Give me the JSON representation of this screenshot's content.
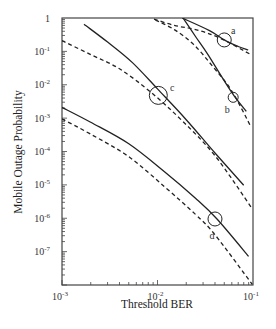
{
  "chart_data": {
    "type": "line",
    "title": "",
    "xlabel": "Threshold BER",
    "ylabel": "Mobile Outage Probability",
    "xscale": "log",
    "yscale": "log",
    "xlim": [
      0.001,
      0.1
    ],
    "ylim": [
      1e-08,
      1
    ],
    "grid": false,
    "legend": null,
    "x_ticks": [
      {
        "value": 0.001,
        "base": "10",
        "exp": "-3"
      },
      {
        "value": 0.01,
        "base": "10",
        "exp": "-2"
      },
      {
        "value": 0.1,
        "base": "10",
        "exp": "-1"
      }
    ],
    "y_ticks": [
      {
        "value": 1,
        "base": "1",
        "exp": ""
      },
      {
        "value": 0.1,
        "base": "10",
        "exp": "-1"
      },
      {
        "value": 0.01,
        "base": "10",
        "exp": "-2"
      },
      {
        "value": 0.001,
        "base": "10",
        "exp": "-3"
      },
      {
        "value": 0.0001,
        "base": "10",
        "exp": "-4"
      },
      {
        "value": 1e-05,
        "base": "10",
        "exp": "-5"
      },
      {
        "value": 1e-06,
        "base": "10",
        "exp": "-6"
      },
      {
        "value": 1e-07,
        "base": "10",
        "exp": "-7"
      }
    ],
    "series": [
      {
        "name": "a-solid",
        "style": "solid",
        "x": [
          0.0181,
          0.035,
          0.05,
          0.07,
          0.089
        ],
        "y": [
          1.0,
          0.42,
          0.22,
          0.14,
          0.11
        ]
      },
      {
        "name": "a-dashed",
        "style": "dashed",
        "x": [
          0.0092,
          0.015,
          0.025,
          0.045,
          0.095
        ],
        "y": [
          0.93,
          0.6,
          0.45,
          0.25,
          0.08
        ]
      },
      {
        "name": "b-solid",
        "style": "solid",
        "x": [
          0.0185,
          0.025,
          0.034,
          0.05,
          0.064,
          0.085
        ],
        "y": [
          1.0,
          0.28,
          0.077,
          0.013,
          0.0045,
          0.0016
        ]
      },
      {
        "name": "b-dashed",
        "style": "dashed",
        "x": [
          0.0095,
          0.015,
          0.024,
          0.038,
          0.06,
          0.095
        ],
        "y": [
          0.87,
          0.45,
          0.16,
          0.035,
          0.0065,
          0.00055
        ]
      },
      {
        "name": "c-solid",
        "style": "solid",
        "x": [
          0.0017,
          0.003,
          0.0055,
          0.01,
          0.02,
          0.04,
          0.08
        ],
        "y": [
          0.65,
          0.19,
          0.045,
          0.0075,
          0.0009,
          9e-05,
          9.8e-06
        ]
      },
      {
        "name": "c-dashed",
        "style": "dashed",
        "x": [
          0.001,
          0.002,
          0.004,
          0.0085,
          0.018,
          0.04,
          0.095
        ],
        "y": [
          0.21,
          0.08,
          0.03,
          0.006,
          0.00085,
          7.5e-05,
          2.2e-06
        ]
      },
      {
        "name": "d-solid",
        "style": "solid",
        "x": [
          0.001,
          0.002,
          0.005,
          0.012,
          0.025,
          0.042,
          0.09
        ],
        "y": [
          0.0021,
          0.00075,
          0.00017,
          2.4e-05,
          4e-06,
          9.5e-07,
          7.2e-08
        ]
      },
      {
        "name": "d-dashed",
        "style": "dashed",
        "x": [
          0.001,
          0.002,
          0.005,
          0.012,
          0.025,
          0.04,
          0.098
        ],
        "y": [
          0.00095,
          0.00033,
          7e-05,
          8.5e-06,
          1.3e-06,
          3.2e-07,
          1.05e-08
        ]
      }
    ],
    "annotations": [
      {
        "label": "a",
        "x": 0.05,
        "y": 0.22,
        "circle_r": 7,
        "label_dx": 9,
        "label_dy": -6
      },
      {
        "label": "b",
        "x": 0.062,
        "y": 0.0042,
        "circle_r": 5,
        "label_dx": -6,
        "label_dy": 16
      },
      {
        "label": "c",
        "x": 0.0102,
        "y": 0.0048,
        "circle_r": 9,
        "label_dx": 14,
        "label_dy": -4
      },
      {
        "label": "d",
        "x": 0.04,
        "y": 9.5e-07,
        "circle_r": 7,
        "label_dx": -3,
        "label_dy": 20
      }
    ]
  }
}
